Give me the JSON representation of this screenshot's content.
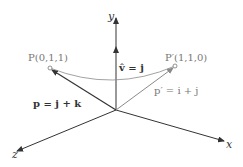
{
  "diagram": {
    "type": "3d-vector-rotation",
    "colors": {
      "dark": "#333333",
      "gray": "#8a8a8a",
      "background": "#ffffff"
    },
    "axes": {
      "y": {
        "label": "y"
      },
      "x": {
        "label": "x"
      },
      "z": {
        "label": "z"
      }
    },
    "points": {
      "P": {
        "label": "P(0,1,1)"
      },
      "P_prime": {
        "label": "P′(1,1,0)"
      }
    },
    "vectors": {
      "v_hat": {
        "label": "v̂ = j"
      },
      "p": {
        "label": "p = j + k"
      },
      "p_prime": {
        "label": "p′ = i + j"
      }
    }
  }
}
